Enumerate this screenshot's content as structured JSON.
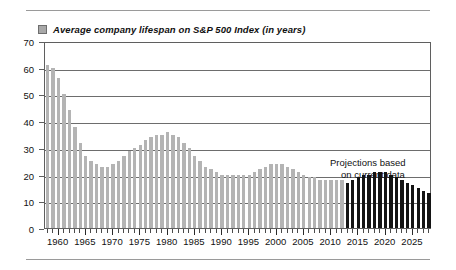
{
  "figure": {
    "legend_label": "Average company lifespan on S&P 500 Index (in years)",
    "legend_swatch_color": "#a8a8a8",
    "annotation_line1": "Projections based",
    "annotation_line2": "on current data"
  },
  "chart_data": {
    "type": "bar",
    "title": "Average company lifespan on S&P 500 Index (in years)",
    "xlabel": "",
    "ylabel": "",
    "ylim": [
      0,
      70
    ],
    "ytick_values": [
      0,
      10,
      20,
      30,
      40,
      50,
      60,
      70
    ],
    "ytick_labels": [
      "0",
      "10",
      "20",
      "30",
      "40",
      "50",
      "60",
      "70"
    ],
    "xlim": [
      1957.5,
      2028.5
    ],
    "xtick_labels": [
      "1960",
      "1965",
      "1970",
      "1975",
      "1980",
      "1985",
      "1990",
      "1995",
      "2000",
      "2005",
      "2010",
      "2015",
      "2020",
      "2025"
    ],
    "xtick_values": [
      1960,
      1965,
      1970,
      1975,
      1980,
      1985,
      1990,
      1995,
      2000,
      2005,
      2010,
      2015,
      2020,
      2025
    ],
    "grid": true,
    "legend_position": "above-plot-left",
    "series": [
      {
        "name": "Historical",
        "color": "#b4b4b4",
        "x": [
          1958,
          1959,
          1960,
          1961,
          1962,
          1963,
          1964,
          1965,
          1966,
          1967,
          1968,
          1969,
          1970,
          1971,
          1972,
          1973,
          1974,
          1975,
          1976,
          1977,
          1978,
          1979,
          1980,
          1981,
          1982,
          1983,
          1984,
          1985,
          1986,
          1987,
          1988,
          1989,
          1990,
          1991,
          1992,
          1993,
          1994,
          1995,
          1996,
          1997,
          1998,
          1999,
          2000,
          2001,
          2002,
          2003,
          2004,
          2005,
          2006,
          2007,
          2008,
          2009,
          2010,
          2011,
          2012
        ],
        "values": [
          61,
          60,
          56,
          50,
          44,
          38,
          32,
          27,
          25,
          24,
          23,
          23,
          24,
          25,
          27,
          29,
          30,
          31,
          33,
          34,
          35,
          35,
          36,
          35,
          34,
          32,
          30,
          27,
          25,
          23,
          22,
          21,
          20,
          20,
          20,
          20,
          20,
          20,
          21,
          22,
          23,
          24,
          24,
          24,
          23,
          22,
          21,
          20,
          19,
          19,
          18,
          18,
          18,
          18,
          18
        ]
      },
      {
        "name": "Projections based on current data",
        "color": "#141414",
        "x": [
          2013,
          2014,
          2015,
          2016,
          2017,
          2018,
          2019,
          2020,
          2021,
          2022,
          2023,
          2024,
          2025,
          2026,
          2027,
          2028
        ],
        "values": [
          17,
          18,
          19,
          20,
          20,
          21,
          21,
          21,
          20,
          19,
          18,
          17,
          16,
          15,
          14,
          13
        ]
      }
    ],
    "annotations": [
      {
        "text": "Projections based on current data",
        "x": 2019,
        "y": 25
      }
    ]
  }
}
